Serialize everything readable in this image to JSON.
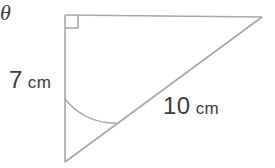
{
  "figure": {
    "background_color": "#ffffff",
    "line_color": "#a8a8a8",
    "text_color": "#3c3c3c",
    "stroke_width": 1.6
  },
  "labels": {
    "vertical_leg": {
      "value": "7",
      "unit": "cm"
    },
    "hypotenuse": {
      "value": "10",
      "unit": "cm"
    },
    "angle": {
      "symbol": "θ"
    }
  },
  "geometry": {
    "vertices": {
      "top_left": {
        "x": 65,
        "y": 15
      },
      "top_right": {
        "x": 262,
        "y": 17
      },
      "bottom_left": {
        "x": 65,
        "y": 162
      }
    },
    "right_angle_marker": {
      "at": "top_left",
      "size": 13
    },
    "angle_arc": {
      "at": "bottom_left",
      "radius": 63,
      "from": "vertical_leg",
      "to": "hypotenuse"
    }
  }
}
